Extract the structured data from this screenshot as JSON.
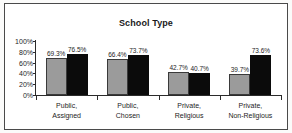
{
  "chart_data": {
    "type": "bar",
    "title": "School Type",
    "xlabel": "",
    "ylabel": "",
    "ylim": [
      0,
      100
    ],
    "grid": false,
    "legend": "none",
    "ytick_labels": [
      "100%",
      "80%",
      "60%",
      "40%",
      "20%",
      "0%"
    ],
    "ytick_values": [
      100,
      80,
      60,
      40,
      20,
      0
    ],
    "categories": [
      {
        "line1": "Public,",
        "line2": "Assigned"
      },
      {
        "line1": "Public,",
        "line2": "Chosen"
      },
      {
        "line1": "Private,",
        "line2": "Religious"
      },
      {
        "line1": "Private,",
        "line2": "Non-Religious"
      }
    ],
    "series": [
      {
        "name": "series-1",
        "color": "#9b9b9b",
        "values": [
          69.3,
          66.4,
          42.7,
          39.7
        ],
        "labels": [
          "69.3%",
          "66.4%",
          "42.7%",
          "39.7%"
        ]
      },
      {
        "name": "series-2",
        "color": "#0b0b0b",
        "values": [
          76.5,
          73.7,
          40.7,
          73.6
        ],
        "labels": [
          "76.5%",
          "73.7%",
          "40.7%",
          "73.6%"
        ]
      }
    ]
  },
  "colors": {
    "series_1": "#9b9b9b",
    "series_2": "#0b0b0b",
    "axis": "#2b2b2b",
    "frame": "#4a4a4a",
    "text": "#1d1d1d"
  }
}
